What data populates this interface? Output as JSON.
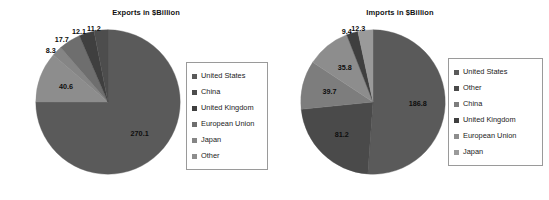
{
  "page": {
    "background": "#ffffff",
    "width": 549,
    "height": 200
  },
  "palette": {
    "united_states": "#5a5a5a",
    "china": "#4d4d4d",
    "united_kingdom": "#3f3f3f",
    "european_union": "#6e6e6e",
    "japan": "#858585",
    "other": "#8d8d8d",
    "legend_border": "#9a9a9a",
    "label_text": "#0d0d0d"
  },
  "charts": [
    {
      "id": "exports",
      "title": "Exports in $Billion",
      "legend": {
        "items": [
          {
            "label": "United States",
            "color": "#5a5a5a"
          },
          {
            "label": "China",
            "color": "#4d4d4d"
          },
          {
            "label": "United Kingdom",
            "color": "#3f3f3f"
          },
          {
            "label": "European Union",
            "color": "#6e6e6e"
          },
          {
            "label": "Japan",
            "color": "#858585"
          },
          {
            "label": "Other",
            "color": "#8d8d8d"
          }
        ]
      }
    },
    {
      "id": "imports",
      "title": "Imports in $Billion",
      "legend": {
        "items": [
          {
            "label": "United States",
            "color": "#5a5a5a"
          },
          {
            "label": "Other",
            "color": "#4a4a4a"
          },
          {
            "label": "China",
            "color": "#7d7d7d"
          },
          {
            "label": "United Kingdom",
            "color": "#3f3f3f"
          },
          {
            "label": "European Union",
            "color": "#8d8d8d"
          },
          {
            "label": "Japan",
            "color": "#9a9a9a"
          }
        ]
      }
    }
  ],
  "chart_data": [
    {
      "type": "pie",
      "id": "exports",
      "title": "Exports in $Billion",
      "unit": "$Billion",
      "legend_position": "right",
      "start_angle_deg": 0,
      "direction": "clockwise",
      "labels": [
        "United States",
        "Other",
        "Japan",
        "European Union",
        "United Kingdom",
        "China"
      ],
      "values": [
        270.1,
        40.6,
        8.3,
        17.7,
        12.1,
        11.2
      ],
      "colors": [
        "#5a5a5a",
        "#8d8d8d",
        "#858585",
        "#6e6e6e",
        "#3f3f3f",
        "#4d4d4d"
      ],
      "data_labels": [
        "270.1",
        "40.6",
        "8.3",
        "17.7",
        "12.1",
        "11.2"
      ],
      "total": 360.0
    },
    {
      "type": "pie",
      "id": "imports",
      "title": "Imports in $Billion",
      "unit": "$Billion",
      "legend_position": "right",
      "start_angle_deg": 0,
      "direction": "clockwise",
      "labels": [
        "United States",
        "Other",
        "China",
        "European Union",
        "United Kingdom",
        "Japan"
      ],
      "values": [
        186.8,
        81.2,
        39.7,
        35.8,
        9.4,
        12.3
      ],
      "colors": [
        "#5a5a5a",
        "#4a4a4a",
        "#7d7d7d",
        "#8d8d8d",
        "#3f3f3f",
        "#9a9a9a"
      ],
      "data_labels": [
        "186.8",
        "81.2",
        "39.7",
        "35.8",
        "9.4",
        "12.3"
      ],
      "total": 365.2
    }
  ]
}
